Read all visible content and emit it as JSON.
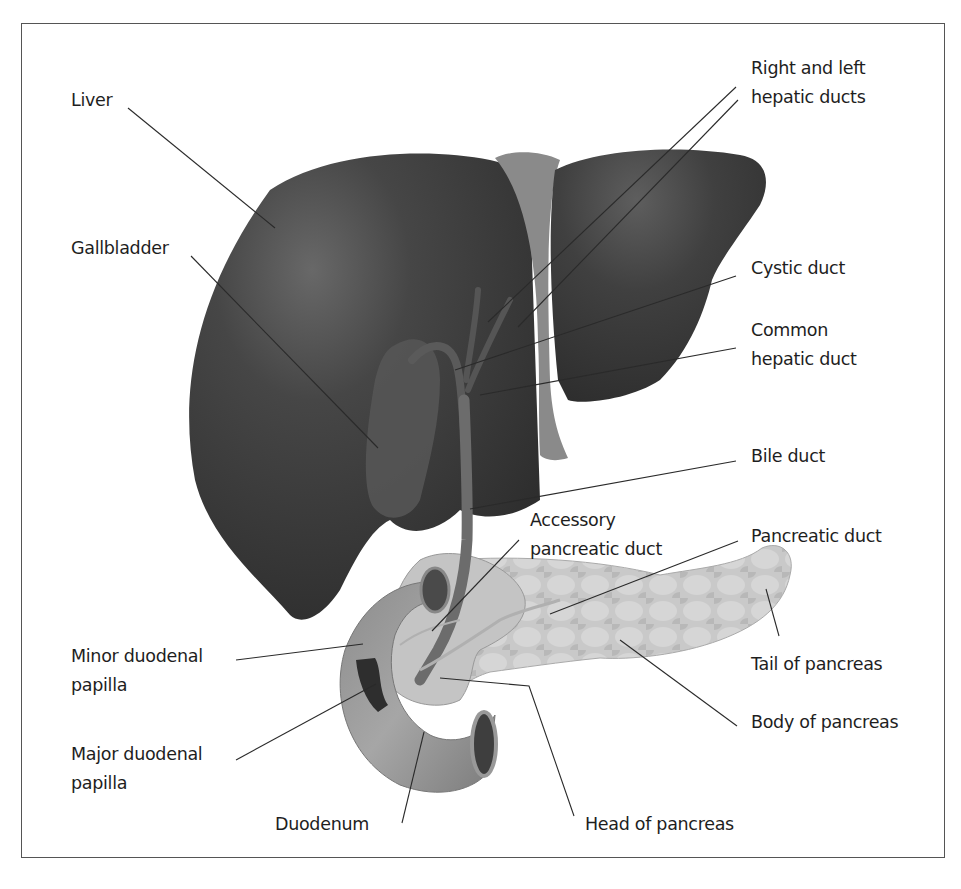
{
  "diagram": {
    "colors": {
      "liver": "#3a3a3a",
      "liver_highlight": "#6a6a6a",
      "ligament": "#8a8a8a",
      "duodenum": "#9a9a9a",
      "pancreas": "#c8c8c8",
      "duct": "#6e6e6e",
      "leader_line": "#2a2a2a",
      "frame": "#555555"
    },
    "labels": {
      "liver": [
        "Liver"
      ],
      "gallbladder": [
        "Gallbladder"
      ],
      "hepatic_ducts": [
        "Right and left",
        "hepatic ducts"
      ],
      "cystic_duct": [
        "Cystic duct"
      ],
      "common_hepatic_duct": [
        "Common",
        "hepatic duct"
      ],
      "bile_duct": [
        "Bile duct"
      ],
      "accessory_pancreatic_duct": [
        "Accessory",
        "pancreatic duct"
      ],
      "pancreatic_duct": [
        "Pancreatic duct"
      ],
      "minor_papilla": [
        "Minor duodenal",
        "papilla"
      ],
      "tail_pancreas": [
        "Tail of pancreas"
      ],
      "body_pancreas": [
        "Body of pancreas"
      ],
      "major_papilla": [
        "Major duodenal",
        "papilla"
      ],
      "duodenum": [
        "Duodenum"
      ],
      "head_pancreas": [
        "Head of pancreas"
      ]
    }
  }
}
